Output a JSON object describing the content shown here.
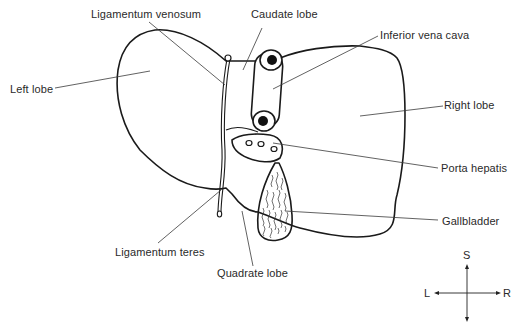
{
  "diagram": {
    "labels": {
      "ligamentum_venosum": "Ligamentum venosum",
      "caudate_lobe": "Caudate lobe",
      "inferior_vena_cava": "Inferior vena cava",
      "left_lobe": "Left lobe",
      "right_lobe": "Right lobe",
      "porta_hepatis": "Porta hepatis",
      "gallbladder": "Gallbladder",
      "ligamentum_teres": "Ligamentum teres",
      "quadrate_lobe": "Quadrate lobe"
    },
    "orientation": {
      "superior": "S",
      "left": "L",
      "right": "R"
    },
    "colors": {
      "stroke": "#1a1a1a",
      "text": "#2a2a2a",
      "background": "#ffffff"
    }
  }
}
